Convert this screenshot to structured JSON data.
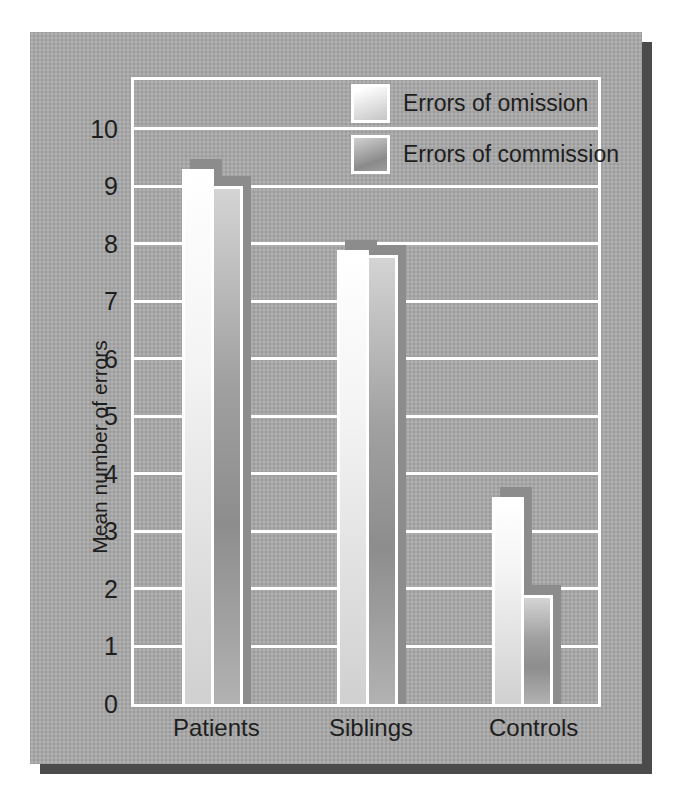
{
  "figure": {
    "panel_color": "#a7a7a7",
    "panel_shadow_color": "#4b4b4b",
    "grid_color": "#ffffff",
    "bar_shadow_color": "#8c8c8c",
    "text_color": "#1e1e1e"
  },
  "chart_data": {
    "type": "bar",
    "categories": [
      "Patients",
      "Siblings",
      "Controls"
    ],
    "series": [
      {
        "name": "Errors of omission",
        "fill": "omission",
        "values": [
          9.3,
          7.9,
          3.6
        ]
      },
      {
        "name": "Errors of commission",
        "fill": "commission",
        "values": [
          9.0,
          7.8,
          1.9
        ]
      }
    ],
    "title": "",
    "xlabel": "",
    "ylabel": "Mean number of errors",
    "ylim": [
      0,
      10.85
    ],
    "yticks": [
      0,
      1,
      2,
      3,
      4,
      5,
      6,
      7,
      8,
      9,
      10
    ],
    "grid": "horizontal-white",
    "legend_position": "top-right-inside"
  }
}
